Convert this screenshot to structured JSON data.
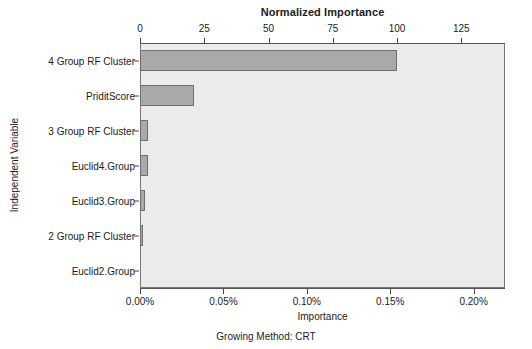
{
  "chart_data": {
    "type": "bar",
    "orientation": "horizontal",
    "title": "Normalized Importance",
    "xlabel": "Importance",
    "ylabel": "Independent Variable",
    "secondary_xlabel": "Normalized Importance",
    "footer": "Growing Method: CRT",
    "grid": false,
    "legend": null,
    "categories": [
      "4 Group RF Cluster",
      "PriditScore",
      "3 Group RF Cluster",
      "Euclid4.Group",
      "Euclid3.Group",
      "2 Group RF Cluster",
      "Euclid2.Group"
    ],
    "series": [
      {
        "name": "Normalized Importance",
        "units": "percent_of_max",
        "values": [
          100.0,
          21.0,
          3.0,
          3.0,
          1.8,
          1.0,
          0.0
        ]
      },
      {
        "name": "Importance",
        "units": "percent",
        "values": [
          0.154,
          0.0324,
          0.0046,
          0.0046,
          0.0028,
          0.0015,
          0.0
        ]
      }
    ],
    "xlim_normalized": [
      0,
      142
    ],
    "xlim_importance": [
      0,
      0.2188
    ],
    "x_ticks_top": [
      "0",
      "25",
      "50",
      "75",
      "100",
      "125"
    ],
    "x_ticks_top_values": [
      0,
      25,
      50,
      75,
      100,
      125
    ],
    "x_ticks_bottom": [
      "0.00%",
      "0.05%",
      "0.10%",
      "0.15%",
      "0.20%"
    ],
    "x_ticks_bottom_values": [
      0.0,
      0.05,
      0.1,
      0.15,
      0.2
    ],
    "colors": {
      "bar_fill": "#a9a9a9",
      "bar_stroke": "#6e6e6e",
      "panel_background": "#ebebeb",
      "panel_border": "#777777",
      "page_background": "#ffffff",
      "text": "#1b1b1b"
    }
  }
}
